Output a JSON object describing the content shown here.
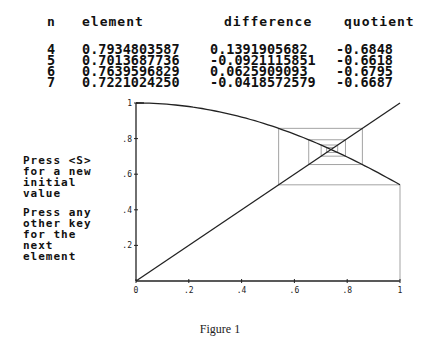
{
  "table": {
    "headers": {
      "n": "n",
      "element": "element",
      "difference": "difference",
      "quotient": "quotient"
    },
    "rows": [
      {
        "n": "4",
        "element": "0.7934803587",
        "difference": " 0.1391905682",
        "quotient": "-0.6848"
      },
      {
        "n": "5",
        "element": "0.7013687736",
        "difference": "-0.0921115851",
        "quotient": "-0.6618"
      },
      {
        "n": "6",
        "element": "0.7639596829",
        "difference": " 0.0625909093",
        "quotient": "-0.6795"
      },
      {
        "n": "7",
        "element": "0.7221024250",
        "difference": "-0.0418572579",
        "quotient": "-0.6687"
      }
    ]
  },
  "prompts": {
    "new_initial": "Press <S>\nfor a new\ninitial\nvalue",
    "next_element": "Press any\nother key\nfor the\nnext\nelement"
  },
  "caption": "Figure 1",
  "chart_data": {
    "type": "line",
    "title": "",
    "xlabel": "",
    "ylabel": "",
    "xlim": [
      0,
      1
    ],
    "ylim": [
      0,
      1
    ],
    "x_ticks": [
      "0",
      ".2",
      ".4",
      ".6",
      ".8",
      "1"
    ],
    "y_ticks": [
      ".2",
      ".4",
      ".6",
      ".8",
      "1"
    ],
    "grid": false,
    "series": [
      {
        "name": "f(x) = cos(x)",
        "x": [
          0,
          0.2,
          0.4,
          0.6,
          0.8,
          1.0
        ],
        "y": [
          1.0,
          0.98,
          0.921,
          0.825,
          0.697,
          0.54
        ]
      },
      {
        "name": "y = x",
        "x": [
          0,
          1
        ],
        "y": [
          0,
          1
        ]
      },
      {
        "name": "cobweb iterates",
        "x": [
          1.0,
          0.5403,
          0.8576,
          0.6543,
          0.7935,
          0.7014,
          0.764,
          0.7221
        ],
        "y": [
          0.5403,
          0.8576,
          0.6543,
          0.7935,
          0.7014,
          0.764,
          0.7221,
          0.7504
        ]
      }
    ]
  }
}
